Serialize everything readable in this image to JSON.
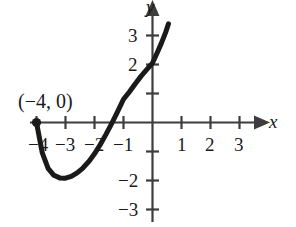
{
  "chart_data": {
    "type": "line",
    "title": "",
    "xlabel": "x",
    "ylabel": "y",
    "xlim": [
      -4.6,
      3.8
    ],
    "ylim": [
      -3.6,
      3.7
    ],
    "grid": false,
    "legend": null,
    "axis_arrows": true,
    "x_ticks": [
      -4,
      -3,
      -2,
      -1,
      1,
      2,
      3
    ],
    "y_ticks": [
      3,
      2,
      1,
      -1,
      -2,
      -3
    ],
    "x_tick_labels": [
      "−4",
      "−3",
      "−2",
      "−1",
      "1",
      "2",
      "3"
    ],
    "y_tick_labels_shown": [
      "3",
      "2",
      "−2",
      "−3"
    ],
    "annotations": [
      {
        "text": "(−4, 0)",
        "x": -4,
        "y": 0,
        "kind": "point-label"
      }
    ],
    "points": [
      {
        "x": -4,
        "y": 0,
        "marker": "filled-circle",
        "label": "(−4, 0)"
      }
    ],
    "series": [
      {
        "name": "curve",
        "style": "solid",
        "width": 5,
        "color": "#1a1a1a",
        "x": [
          -4.0,
          -3.8,
          -3.6,
          -3.4,
          -3.2,
          -3.0,
          -2.8,
          -2.6,
          -2.4,
          -2.2,
          -2.0,
          -1.8,
          -1.6,
          -1.4,
          -1.2,
          -1.0,
          -0.8,
          -0.6,
          -0.4,
          -0.2,
          0.0,
          0.15,
          0.3,
          0.45,
          0.55
        ],
        "y": [
          0.0,
          -1.05,
          -1.58,
          -1.82,
          -1.91,
          -1.92,
          -1.86,
          -1.74,
          -1.57,
          -1.35,
          -1.08,
          -0.76,
          -0.4,
          -0.02,
          0.38,
          0.8,
          1.05,
          1.33,
          1.59,
          1.82,
          2.05,
          2.38,
          2.72,
          3.1,
          3.4
        ]
      }
    ]
  },
  "labels": {
    "x_axis_name": "x",
    "y_axis_name": "y",
    "point_annotation": "(−4, 0)",
    "x_neg_4": "−4",
    "x_neg_3": "−3",
    "x_neg_2": "−2",
    "x_neg_1": "−1",
    "x_pos_1": "1",
    "x_pos_2": "2",
    "x_pos_3": "3",
    "y_pos_3": "3",
    "y_pos_2": "2",
    "y_neg_2": "−2",
    "y_neg_3": "−3"
  },
  "colors": {
    "ink": "#1a1a1a",
    "curve": "#1a1a1a",
    "axis": "#4a4a4a",
    "background": "#ffffff"
  }
}
